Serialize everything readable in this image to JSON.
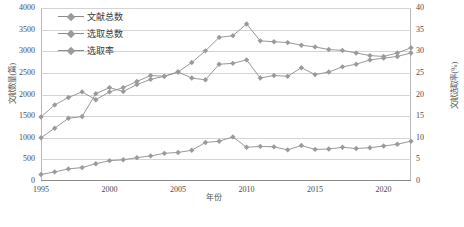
{
  "chart_data": {
    "type": "line",
    "title": "",
    "xlabel": "年份",
    "ylabel": "文献数量(篇)",
    "ylabel_right": "文献选取率(%)",
    "xlim": [
      1995,
      2022
    ],
    "ylim": [
      0,
      4000
    ],
    "ylim_right": [
      0,
      40
    ],
    "grid": true,
    "legend_position": "top-left",
    "x": [
      1995,
      1996,
      1997,
      1998,
      1999,
      2000,
      2001,
      2002,
      2003,
      2004,
      2005,
      2006,
      2007,
      2008,
      2009,
      2010,
      2011,
      2012,
      2013,
      2014,
      2015,
      2016,
      2017,
      2018,
      2019,
      2020,
      2021,
      2022
    ],
    "xticks": [
      1995,
      2000,
      2005,
      2010,
      2015,
      2020
    ],
    "yticks_left": [
      0,
      500,
      1000,
      1500,
      2000,
      2500,
      3000,
      3500,
      4000
    ],
    "yticks_right": [
      0,
      5,
      10,
      15,
      20,
      25,
      30,
      35,
      40
    ],
    "series": [
      {
        "name": "文献总数",
        "axis": "left",
        "color": "#8c8c8c",
        "values": [
          1480,
          1760,
          1930,
          2060,
          1880,
          2060,
          2160,
          2300,
          2440,
          2420,
          2520,
          2740,
          3010,
          3320,
          3360,
          3630,
          3240,
          3220,
          3200,
          3140,
          3100,
          3040,
          3020,
          2960,
          2900,
          2880,
          2960,
          3080
        ]
      },
      {
        "name": "选取总数",
        "axis": "left",
        "color": "#8c8c8c",
        "values": [
          1000,
          1220,
          1450,
          1490,
          2020,
          2160,
          2070,
          2230,
          2350,
          2420,
          2520,
          2380,
          2340,
          2700,
          2720,
          2800,
          2380,
          2440,
          2420,
          2620,
          2460,
          2520,
          2640,
          2700,
          2800,
          2840,
          2880,
          2960
        ]
      },
      {
        "name": "选取率",
        "axis": "right",
        "color": "#8c8c8c",
        "values": [
          1.5,
          2.1,
          2.8,
          3.1,
          4.0,
          4.7,
          4.9,
          5.4,
          5.8,
          6.4,
          6.6,
          7.1,
          8.9,
          9.2,
          10.2,
          7.8,
          8.0,
          7.9,
          7.2,
          8.2,
          7.3,
          7.4,
          7.8,
          7.5,
          7.7,
          8.1,
          8.5,
          9.2
        ]
      }
    ]
  },
  "legend": {
    "items": [
      {
        "label": "文献总数"
      },
      {
        "label": "选取总数"
      },
      {
        "label": "选取率"
      }
    ]
  },
  "caption": ""
}
